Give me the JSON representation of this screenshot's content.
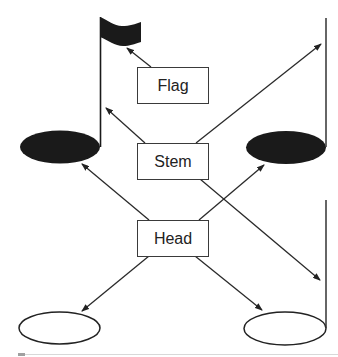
{
  "diagram": {
    "labels": {
      "flag": "Flag",
      "stem": "Stem",
      "head": "Head"
    },
    "colors": {
      "ink": "#1a1a1a",
      "line": "#333333",
      "box_border": "#3a3a3a",
      "background": "#ffffff"
    },
    "notes": [
      {
        "name": "eighth-note",
        "head": "filled",
        "stem": "up",
        "flag": true,
        "position": "top-left"
      },
      {
        "name": "quarter-note",
        "head": "filled",
        "stem": "up",
        "flag": false,
        "position": "top-right"
      },
      {
        "name": "whole-note",
        "head": "open",
        "stem": "none",
        "flag": false,
        "position": "bottom-left"
      },
      {
        "name": "half-note",
        "head": "open",
        "stem": "up",
        "flag": false,
        "position": "bottom-right"
      }
    ],
    "arrows": [
      {
        "from": "flag",
        "to": "eighth-note-flag"
      },
      {
        "from": "stem",
        "to": "eighth-note-stem"
      },
      {
        "from": "stem",
        "to": "quarter-note-stem"
      },
      {
        "from": "stem",
        "to": "half-note-stem"
      },
      {
        "from": "head",
        "to": "eighth-note-head"
      },
      {
        "from": "head",
        "to": "quarter-note-head"
      },
      {
        "from": "head",
        "to": "whole-note-head"
      },
      {
        "from": "head",
        "to": "half-note-head"
      }
    ]
  }
}
